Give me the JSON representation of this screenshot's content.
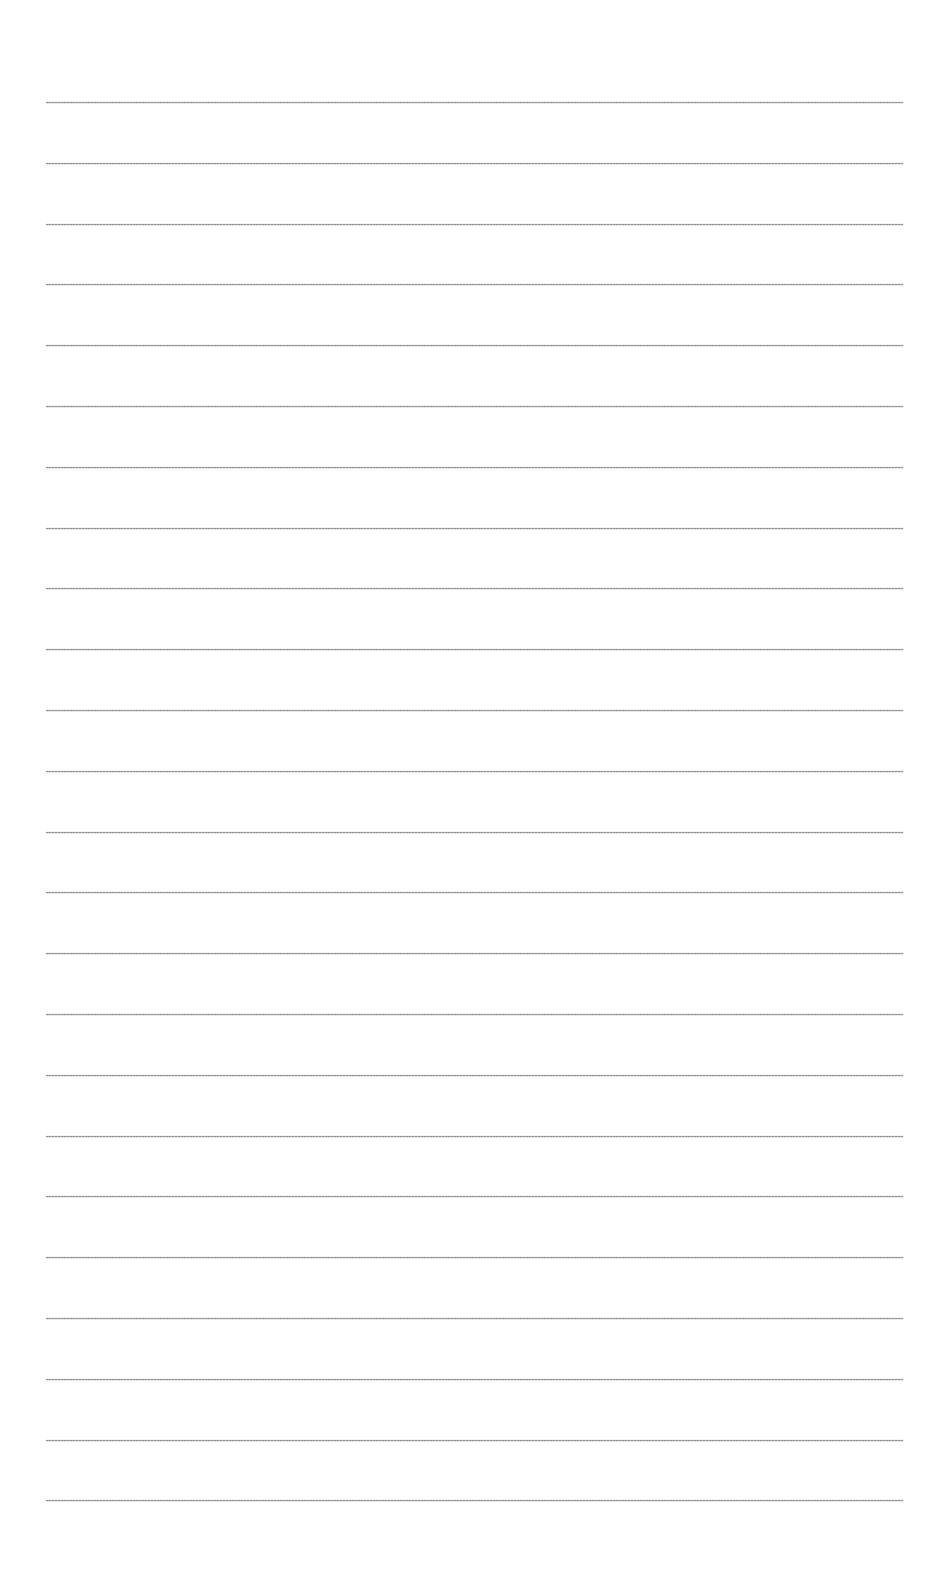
{
  "page": {
    "type": "blank lined paper",
    "background_color": "#ffffff",
    "line_color": "#9a9a9a",
    "line_count": 24,
    "line_left_px": 46,
    "line_right_px": 903,
    "first_line_y_px": 102,
    "line_spacing_px": 60.8,
    "text": ""
  }
}
